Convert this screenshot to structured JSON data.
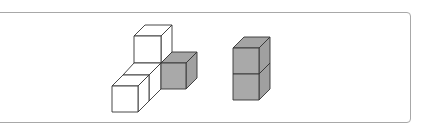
{
  "figure": {
    "colors": {
      "white_face": "#ffffff",
      "gray_face": "#a9a9a9",
      "gray_top": "#a4a4a4",
      "gray_side": "#a0a0a0",
      "edge": "#333333",
      "frame": "#a8a8a8"
    },
    "left_structure": {
      "label": "",
      "cubes": [
        {
          "position": "top",
          "fill": "white"
        },
        {
          "position": "middle-back",
          "fill": "white"
        },
        {
          "position": "bottom-front-left",
          "fill": "white"
        },
        {
          "position": "right",
          "fill": "gray"
        }
      ]
    },
    "right_structure": {
      "label": "",
      "cubes": [
        {
          "position": "top",
          "fill": "gray"
        },
        {
          "position": "bottom",
          "fill": "gray"
        }
      ]
    }
  }
}
